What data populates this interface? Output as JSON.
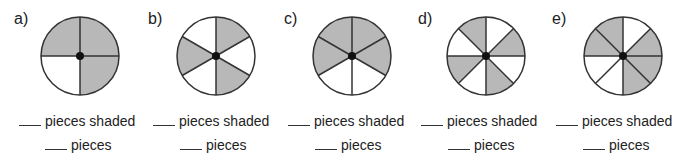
{
  "colors": {
    "shade": "#b8b8b8",
    "line": "#333333",
    "background": "#ffffff"
  },
  "problems": [
    {
      "label": "a)",
      "pieces": 4,
      "shaded": [
        0,
        1,
        3
      ],
      "line1": "pieces shaded",
      "line2": "pieces"
    },
    {
      "label": "b)",
      "pieces": 6,
      "shaded": [
        0,
        2,
        4
      ],
      "line1": "pieces shaded",
      "line2": "pieces"
    },
    {
      "label": "c)",
      "pieces": 6,
      "shaded": [
        0,
        1,
        4,
        5
      ],
      "line1": "pieces shaded",
      "line2": "pieces"
    },
    {
      "label": "d)",
      "pieces": 8,
      "shaded": [
        1,
        3,
        5,
        7
      ],
      "line1": "pieces shaded",
      "line2": "pieces"
    },
    {
      "label": "e)",
      "pieces": 8,
      "shaded": [
        1,
        2,
        3,
        6,
        7
      ],
      "line1": "pieces shaded",
      "line2": "pieces"
    }
  ]
}
